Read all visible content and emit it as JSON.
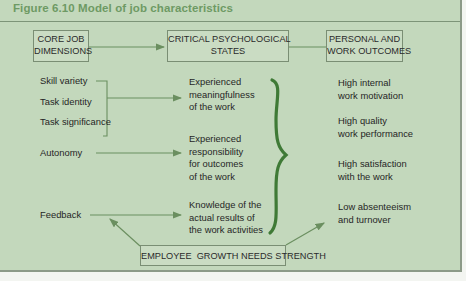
{
  "figure": {
    "title": "Figure 6.10  Model of job characteristics"
  },
  "headers": {
    "core": "CORE JOB\nDIMENSIONS",
    "critical": "CRITICAL PSYCHOLOGICAL\nSTATES",
    "outcomes": "PERSONAL AND\nWORK OUTCOMES"
  },
  "core_dimensions": [
    "Skill variety",
    "Task identity",
    "Task significance",
    "Autonomy",
    "Feedback"
  ],
  "critical_states": [
    "Experienced\nmeaningfulness\nof the work",
    "Experienced\nresponsibility\nfor outcomes\nof the work",
    "Knowledge of the\nactual results of\nthe work activities"
  ],
  "outcomes": [
    "High internal\nwork motivation",
    "High quality\nwork performance",
    "High satisfaction\nwith the work",
    "Low absenteeism\nand turnover"
  ],
  "moderator": "EMPLOYEE  GROWTH NEEDS STRENGTH",
  "colors": {
    "panel": "#c3d8bc",
    "title": "#6e9a64",
    "arrow": "#6b8f60",
    "brace": "#3f7a36"
  }
}
